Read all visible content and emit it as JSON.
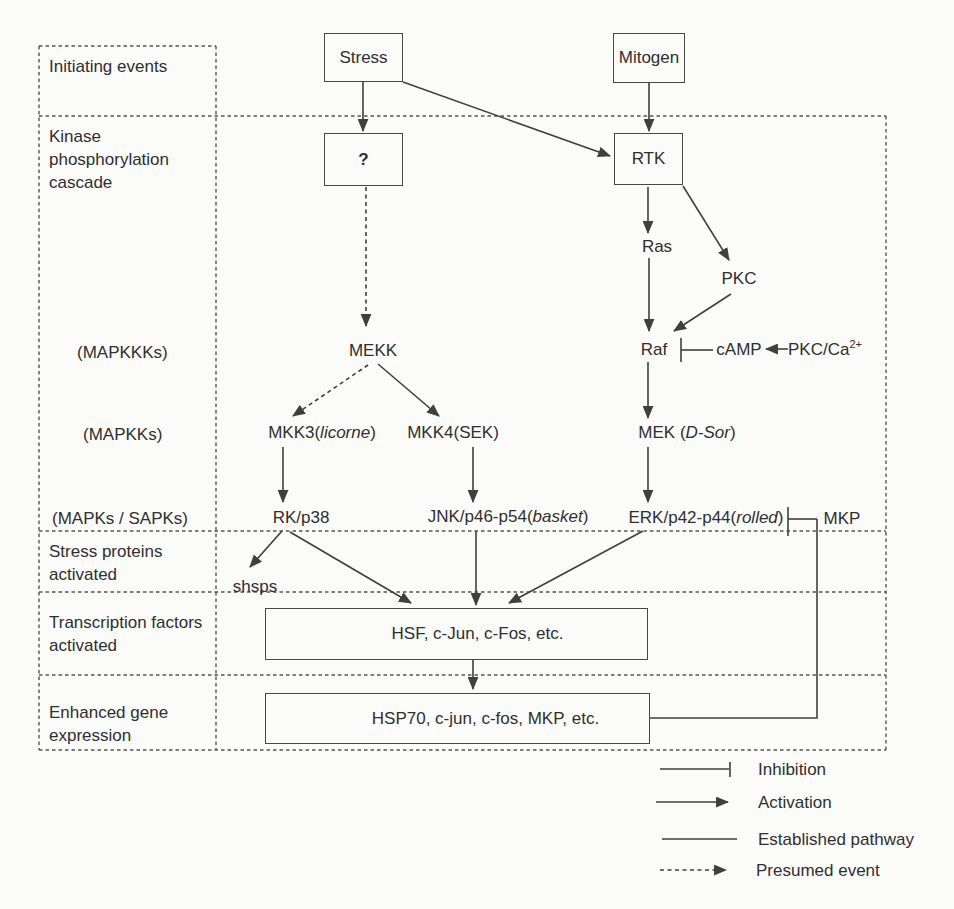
{
  "colors": {
    "line": "#3f3f3f",
    "border_dash": "#555555",
    "text": "#2f2f2f",
    "background": "#fbfbf9"
  },
  "rows": {
    "initiating_events": "Initiating events",
    "kinase_cascade": "Kinase phosphorylation cascade",
    "mapkkks": "(MAPKKKs)",
    "mapkks": "(MAPKKs)",
    "mapks_sapks": "(MAPKs / SAPKs)",
    "stress_proteins": "Stress proteins activated",
    "transcription_factors": "Transcription factors activated",
    "enhanced_gene": "Enhanced gene expression"
  },
  "nodes": {
    "stress": "Stress",
    "mitogen": "Mitogen",
    "unknown_kinase": "?",
    "rtk": "RTK",
    "ras": "Ras",
    "pkc": "PKC",
    "mekk": "MEKK",
    "raf": "Raf",
    "camp": "cAMP",
    "pkc_ca_base": "PKC/Ca",
    "pkc_ca_sup": "2+",
    "mkk3_prefix": "MKK3(",
    "mkk3_italic": "licorne",
    "mkk3_suffix": ")",
    "mkk4": "MKK4(SEK)",
    "mek_prefix": "MEK (",
    "mek_italic": "D-Sor",
    "mek_suffix": ")",
    "rk_p38": "RK/p38",
    "jnk_prefix": "JNK/p46-p54(",
    "jnk_italic": "basket",
    "jnk_suffix": ")",
    "erk_prefix": "ERK/p42-p44(",
    "erk_italic": "rolled",
    "erk_suffix": ")",
    "mkp": "MKP",
    "shsps": "shsps",
    "hsf_box": "HSF, c-Jun, c-Fos, etc.",
    "hsp70_box": "HSP70, c-jun, c-fos, MKP, etc."
  },
  "legend": {
    "inhibition": "Inhibition",
    "activation": "Activation",
    "established": "Established pathway",
    "presumed": "Presumed event"
  }
}
